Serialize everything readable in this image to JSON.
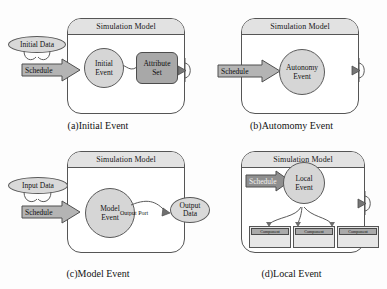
{
  "figure": {
    "colors": {
      "header_fill": "#e2e2e2",
      "circle_fill": "#d6d6d6",
      "oval_fill": "#d9d9d9",
      "attr_fill": "#a8a8a8",
      "arrow_fill": "#b4b4b4",
      "arrow_dark_fill": "#8f8f8f",
      "component_fill": "#e6e6e6",
      "component_head_fill": "#a9a9a9",
      "stroke": "#555555",
      "background": "#fdfdfd"
    }
  },
  "panels": [
    {
      "id": "a",
      "caption": "(a)Initial Event",
      "model_title": "Simulation Model",
      "input_oval": "Initial Data",
      "schedule_label": "Schedule",
      "event_line1": "Initial",
      "event_line2": "Event",
      "attribute_line1": "Attribute",
      "attribute_line2": "Set"
    },
    {
      "id": "b",
      "caption": "(b)Automomy Event",
      "model_title": "Simulation Model",
      "schedule_label": "Schedule",
      "event_line1": "Autonomy",
      "event_line2": "Event"
    },
    {
      "id": "c",
      "caption": "(c)Model Event",
      "model_title": "Simulation Model",
      "input_oval": "Input Data",
      "schedule_label": "Schedule",
      "event_line1": "Model",
      "event_line2": "Event",
      "output_port_label": "Output Port",
      "output_oval_line1": "Output",
      "output_oval_line2": "Data"
    },
    {
      "id": "d",
      "caption": "(d)Local Event",
      "model_title": "Simulation Model",
      "schedule_label": "Schedule",
      "event_line1": "Local",
      "event_line2": "Event",
      "components": [
        {
          "label": "Component"
        },
        {
          "label": "Component"
        },
        {
          "label": "Component"
        }
      ]
    }
  ]
}
